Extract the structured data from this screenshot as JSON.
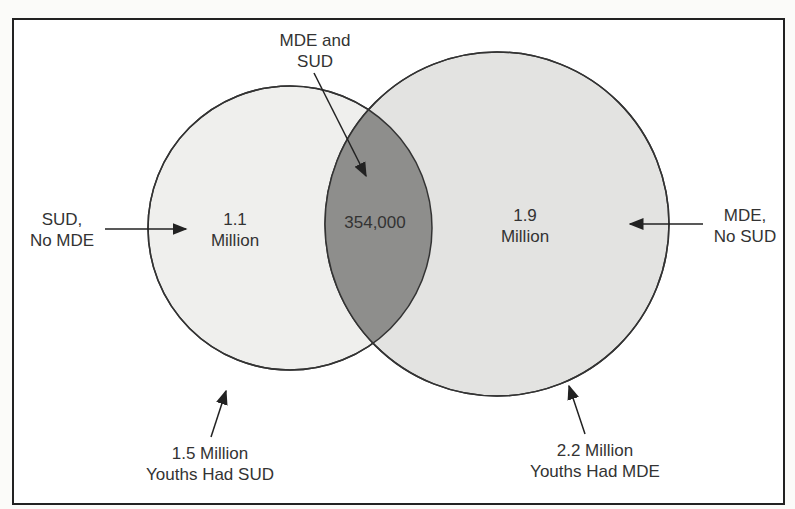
{
  "diagram": {
    "type": "venn",
    "sets": [
      {
        "name": "SUD",
        "total_label": "1.5 Million",
        "caption": "Youths Had SUD",
        "only_label": "SUD,",
        "only_label2": "No MDE",
        "only_value_line1": "1.1",
        "only_value_line2": "Million",
        "fill": "#efefed"
      },
      {
        "name": "MDE",
        "total_label": "2.2 Million",
        "caption": "Youths Had MDE",
        "only_label": "MDE,",
        "only_label2": "No SUD",
        "only_value_line1": "1.9",
        "only_value_line2": "Million",
        "fill": "#e3e3e1"
      }
    ],
    "intersection": {
      "label_line1": "MDE and",
      "label_line2": "SUD",
      "value": "354,000",
      "fill": "#8e8e8c"
    },
    "colors": {
      "outline": "#333333",
      "border": "#222222"
    }
  }
}
